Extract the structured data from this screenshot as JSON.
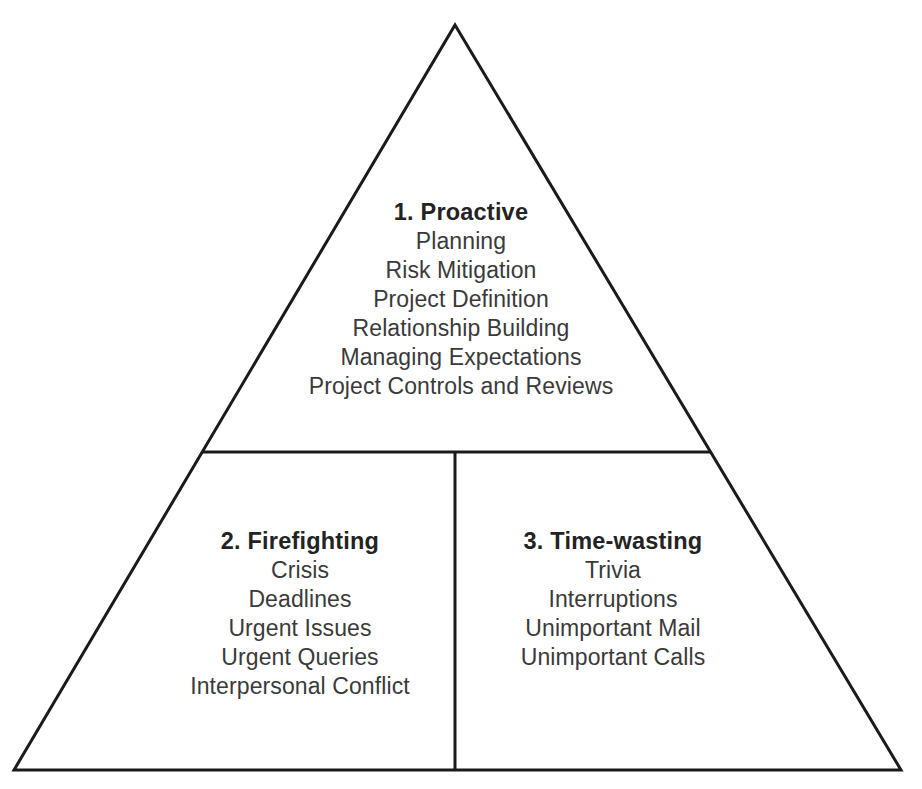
{
  "diagram": {
    "shape": "triangle",
    "stroke_color": "#1a1a1a",
    "stroke_width": 3,
    "background_color": "#ffffff",
    "heading_color": "#232323",
    "text_color": "#3a3a3a",
    "geometry": {
      "apex": [
        455,
        25
      ],
      "bottom_left": [
        14,
        770
      ],
      "bottom_right": [
        901,
        770
      ],
      "horizontal_divider_y": 452,
      "horizontal_divider_x1": 203,
      "horizontal_divider_x2": 710,
      "vertical_divider_x": 455,
      "vertical_divider_y1": 452,
      "vertical_divider_y2": 770
    },
    "sections": [
      {
        "id": "proactive",
        "heading": "1. Proactive",
        "items": [
          "Planning",
          "Risk Mitigation",
          "Project Definition",
          "Relationship Building",
          "Managing Expectations",
          "Project Controls and Reviews"
        ]
      },
      {
        "id": "firefighting",
        "heading": "2. Firefighting",
        "items": [
          "Crisis",
          "Deadlines",
          "Urgent Issues",
          "Urgent Queries",
          "Interpersonal Conflict"
        ]
      },
      {
        "id": "timewasting",
        "heading": "3. Time-wasting",
        "items": [
          "Trivia",
          "Interruptions",
          "Unimportant Mail",
          "Unimportant Calls"
        ]
      }
    ]
  }
}
